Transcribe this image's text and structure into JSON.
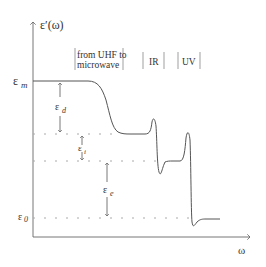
{
  "diagram": {
    "y_axis_label": "ε′(ω)",
    "x_axis_label": "ω",
    "levels": {
      "em": "ε",
      "em_sub": "m",
      "e0": "ε",
      "e0_sub": "0"
    },
    "contributions": {
      "ed": "ε",
      "ed_sub": "d",
      "ei": "ε",
      "ei_sub": "i",
      "ee": "ε",
      "ee_sub": "e"
    },
    "regions": {
      "microwave_line1": "from UHF to",
      "microwave_line2": "microwave",
      "ir": "IR",
      "uv": "UV"
    },
    "colors": {
      "line": "#555555",
      "dotted": "#aaaaaa",
      "text": "#333333"
    }
  }
}
